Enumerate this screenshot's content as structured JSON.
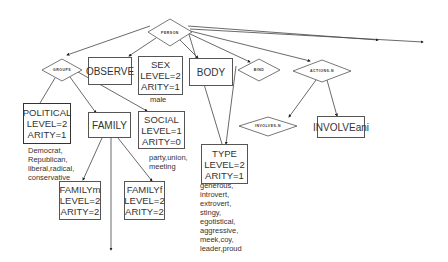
{
  "diagram": {
    "diamonds": [
      {
        "id": "person",
        "label": "PERSON",
        "cx": 170,
        "cy": 33
      },
      {
        "id": "groups",
        "label": "GROUPS",
        "cx": 62,
        "cy": 70
      },
      {
        "id": "bind",
        "label": "BIND",
        "cx": 259,
        "cy": 70
      },
      {
        "id": "actions",
        "label": "ACTIONS-N",
        "cx": 322,
        "cy": 71
      },
      {
        "id": "involves",
        "label": "INVOLVES-N",
        "cx": 268,
        "cy": 126
      }
    ],
    "boxes": [
      {
        "id": "observe",
        "lines": [
          "OBSERVE"
        ]
      },
      {
        "id": "sex",
        "lines": [
          "SEX",
          "LEVEL=2",
          "ARITY=1"
        ]
      },
      {
        "id": "body",
        "lines": [
          "BODY"
        ]
      },
      {
        "id": "political",
        "lines": [
          "POLITICAL",
          "LEVEL=2",
          "ARITY=1"
        ]
      },
      {
        "id": "family",
        "lines": [
          "FAMILY"
        ]
      },
      {
        "id": "social",
        "lines": [
          "SOCIAL",
          "LEVEL=1",
          "ARITY=0"
        ]
      },
      {
        "id": "type",
        "lines": [
          "TYPE",
          "LEVEL=2",
          "ARITY=1"
        ]
      },
      {
        "id": "involveani",
        "lines": [
          "INVOLVEani"
        ]
      },
      {
        "id": "familym",
        "lines": [
          "FAMILYm",
          "LEVEL=2",
          "ARITY=2"
        ]
      },
      {
        "id": "familyf",
        "lines": [
          "FAMILYf",
          "LEVEL=2",
          "ARITY=2"
        ]
      }
    ],
    "notes": {
      "sex": "male",
      "political": "Democrat,\nRepublican,\nliberal,radical,\nconservative",
      "social": "party,union,\nmeeting",
      "type": "generous,\nintrovert,\nextrovert,\nstingy,\negotistical,\naggressive,\nmeek,coy,\nleader,proud"
    }
  }
}
